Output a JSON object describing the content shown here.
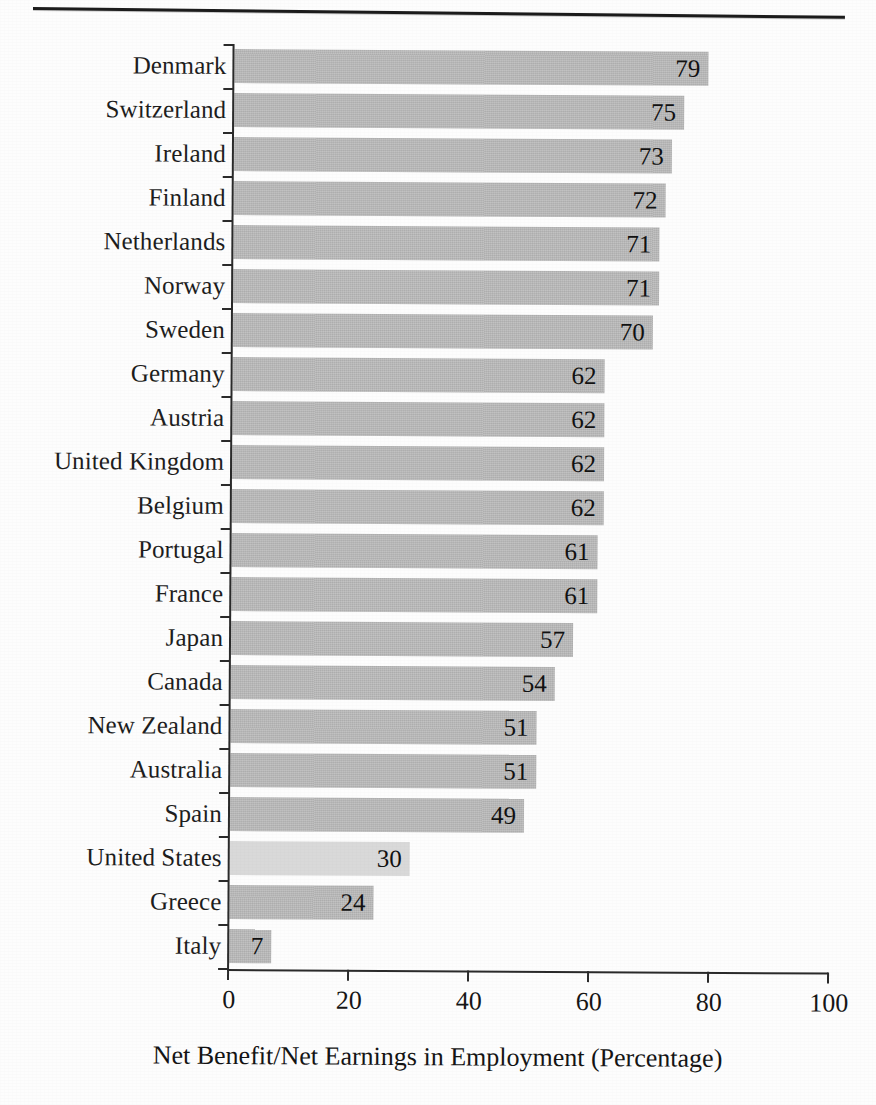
{
  "figure": {
    "top_rule": "horizontal-rule"
  },
  "axis": {
    "x_title": "Net Benefit/Net Earnings in Employment (Percentage)",
    "x_ticks": [
      "0",
      "20",
      "40",
      "60",
      "80",
      "100"
    ]
  },
  "colors": {
    "bar": "#b6b6b6",
    "bar_highlight": "#d9d9d9",
    "axis": "#2a2a2a",
    "text": "#161616",
    "background": "#fdfdfd"
  },
  "chart_data": {
    "type": "bar",
    "orientation": "horizontal",
    "title": "",
    "subtitle": "",
    "xlabel": "Net Benefit/Net Earnings in Employment (Percentage)",
    "ylabel": "",
    "xlim": [
      0,
      100
    ],
    "xticks": [
      0,
      20,
      40,
      60,
      80,
      100
    ],
    "grid": false,
    "legend": false,
    "value_labels": true,
    "highlight_category": "United States",
    "categories": [
      "Denmark",
      "Switzerland",
      "Ireland",
      "Finland",
      "Netherlands",
      "Norway",
      "Sweden",
      "Germany",
      "Austria",
      "United Kingdom",
      "Belgium",
      "Portugal",
      "France",
      "Japan",
      "Canada",
      "New Zealand",
      "Australia",
      "Spain",
      "United States",
      "Greece",
      "Italy"
    ],
    "values": [
      79,
      75,
      73,
      72,
      71,
      71,
      70,
      62,
      62,
      62,
      62,
      61,
      61,
      57,
      54,
      51,
      51,
      49,
      30,
      24,
      7
    ]
  }
}
